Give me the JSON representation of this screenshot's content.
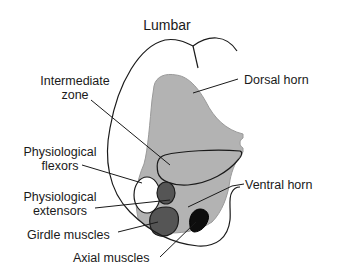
{
  "diagram": {
    "title": "Lumbar",
    "labels": {
      "intermediate_zone_line1": "Intermediate",
      "intermediate_zone_line2": "zone",
      "dorsal_horn": "Dorsal horn",
      "physiological_flexors_line1": "Physiological",
      "physiological_flexors_line2": "flexors",
      "physiological_extensors_line1": "Physiological",
      "physiological_extensors_line2": "extensors",
      "ventral_horn": "Ventral horn",
      "girdle_muscles": "Girdle muscles",
      "axial_muscles": "Axial muscles"
    },
    "colors": {
      "gray_matter": "#b3b3b3",
      "gray_matter_edge": "#8f8f8f",
      "flexors": "#ffffff",
      "extensors": "#555555",
      "girdle": "#555555",
      "axial": "#0d0d0d",
      "outline": "#1a1a1a"
    }
  }
}
